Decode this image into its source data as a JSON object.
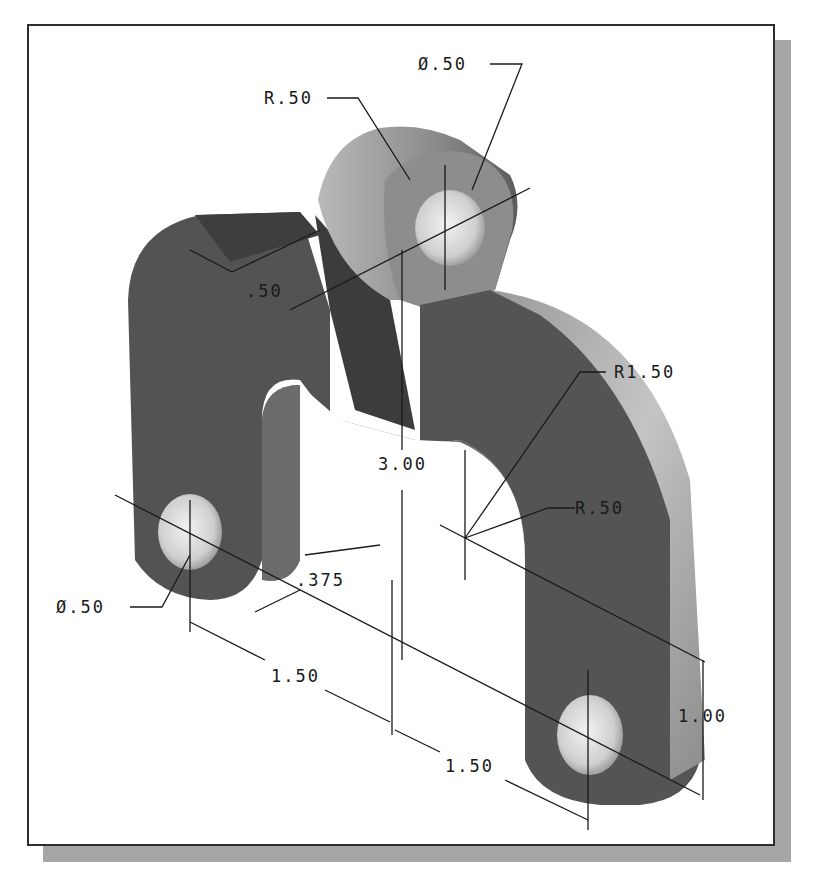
{
  "figure": {
    "colors": {
      "frame_border": "#2e2e2e",
      "shadow": "#a6a6a6",
      "body_dark": "#4d4d4d",
      "body_mid": "#6e6e6e",
      "body_light": "#bdbdbd",
      "hole_light": "#e6e6e6"
    }
  },
  "dimensions": {
    "top_hole_diameter": "Ø.50",
    "top_boss_radius": "R.50",
    "boss_thickness": ".50",
    "outer_arc_radius": "R1.50",
    "inner_arc_radius": "R.50",
    "overall_height": "3.00",
    "slot_width": ".375",
    "left_hole_diameter": "Ø.50",
    "left_hole_spacing": "1.50",
    "right_hole_spacing": "1.50",
    "foot_height": "1.00"
  }
}
